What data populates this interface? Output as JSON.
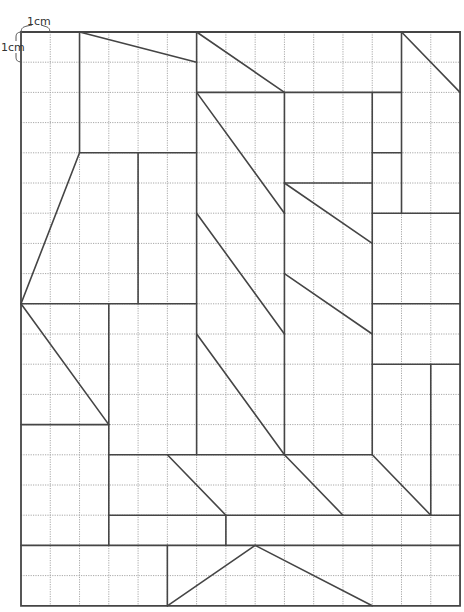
{
  "diagram": {
    "grid": {
      "columns": 15,
      "rows": 19,
      "origin_x": 21,
      "origin_y": 32,
      "cell_width": 29.27,
      "cell_height": 30.2,
      "grid_color": "#a8a8a8",
      "line_color": "#454545"
    },
    "scale_labels": {
      "horizontal": "1cm",
      "vertical": "1cm"
    },
    "border": [
      [
        0,
        0
      ],
      [
        15,
        0
      ],
      [
        15,
        19
      ],
      [
        0,
        19
      ]
    ],
    "segments": [
      [
        [
          2,
          0
        ],
        [
          2,
          4
        ]
      ],
      [
        [
          2,
          0
        ],
        [
          6,
          1
        ]
      ],
      [
        [
          2,
          4
        ],
        [
          6,
          4
        ]
      ],
      [
        [
          4,
          4
        ],
        [
          4,
          9
        ]
      ],
      [
        [
          2,
          4
        ],
        [
          0,
          9
        ]
      ],
      [
        [
          6,
          0
        ],
        [
          6,
          14
        ]
      ],
      [
        [
          6,
          0
        ],
        [
          9,
          2
        ]
      ],
      [
        [
          6,
          2
        ],
        [
          13,
          2
        ]
      ],
      [
        [
          13,
          0
        ],
        [
          13,
          6
        ]
      ],
      [
        [
          13,
          0
        ],
        [
          15,
          2
        ]
      ],
      [
        [
          9,
          2
        ],
        [
          9,
          14
        ]
      ],
      [
        [
          12,
          2
        ],
        [
          12,
          14
        ]
      ],
      [
        [
          12,
          4
        ],
        [
          13,
          4
        ]
      ],
      [
        [
          12,
          6
        ],
        [
          15,
          6
        ]
      ],
      [
        [
          6,
          2
        ],
        [
          9,
          6
        ]
      ],
      [
        [
          9,
          5
        ],
        [
          12,
          5
        ]
      ],
      [
        [
          9,
          5
        ],
        [
          12,
          7
        ]
      ],
      [
        [
          0,
          9
        ],
        [
          6,
          9
        ]
      ],
      [
        [
          6,
          6
        ],
        [
          9,
          10
        ]
      ],
      [
        [
          12,
          9
        ],
        [
          15,
          9
        ]
      ],
      [
        [
          9,
          8
        ],
        [
          12,
          10
        ]
      ],
      [
        [
          6,
          10
        ],
        [
          9,
          14
        ]
      ],
      [
        [
          12,
          11
        ],
        [
          15,
          11
        ]
      ],
      [
        [
          14,
          11
        ],
        [
          14,
          16
        ]
      ],
      [
        [
          0,
          9
        ],
        [
          3,
          13
        ]
      ],
      [
        [
          3,
          9
        ],
        [
          3,
          17
        ]
      ],
      [
        [
          0,
          13
        ],
        [
          3,
          13
        ]
      ],
      [
        [
          3,
          14
        ],
        [
          12,
          14
        ]
      ],
      [
        [
          5,
          14
        ],
        [
          7,
          16
        ]
      ],
      [
        [
          9,
          14
        ],
        [
          11,
          16
        ]
      ],
      [
        [
          12,
          14
        ],
        [
          14,
          16
        ]
      ],
      [
        [
          3,
          16
        ],
        [
          15,
          16
        ]
      ],
      [
        [
          7,
          16
        ],
        [
          7,
          17
        ]
      ],
      [
        [
          0,
          17
        ],
        [
          15,
          17
        ]
      ],
      [
        [
          5,
          17
        ],
        [
          5,
          19
        ]
      ],
      [
        [
          5,
          19
        ],
        [
          8,
          17
        ]
      ],
      [
        [
          8,
          17
        ],
        [
          12,
          19
        ]
      ]
    ]
  }
}
